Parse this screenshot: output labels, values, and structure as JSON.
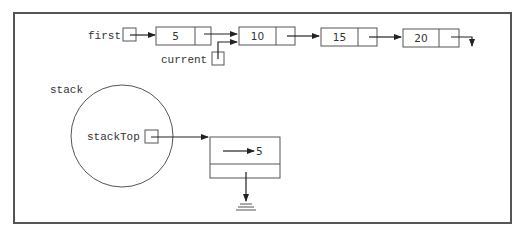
{
  "diagram": {
    "type": "linked-list-and-stack",
    "frame": {
      "x": 14,
      "y": 13,
      "w": 497,
      "h": 210
    },
    "pointers": {
      "first": {
        "label": "first"
      },
      "current": {
        "label": "current"
      }
    },
    "list_nodes": [
      {
        "value": "5",
        "x": 156,
        "divider": 195,
        "w": 55
      },
      {
        "value": "10",
        "x": 239,
        "divider": 276,
        "w": 56
      },
      {
        "value": "15",
        "x": 321,
        "divider": 358,
        "w": 56
      },
      {
        "value": "20",
        "x": 403,
        "divider": 439,
        "w": 56
      }
    ],
    "stack": {
      "label": "stack",
      "member_label": "stackTop",
      "node": {
        "value": "5"
      }
    },
    "colors": {
      "stroke": "#555555",
      "arrow": "#222222",
      "text": "#333333",
      "background": "#ffffff"
    }
  }
}
